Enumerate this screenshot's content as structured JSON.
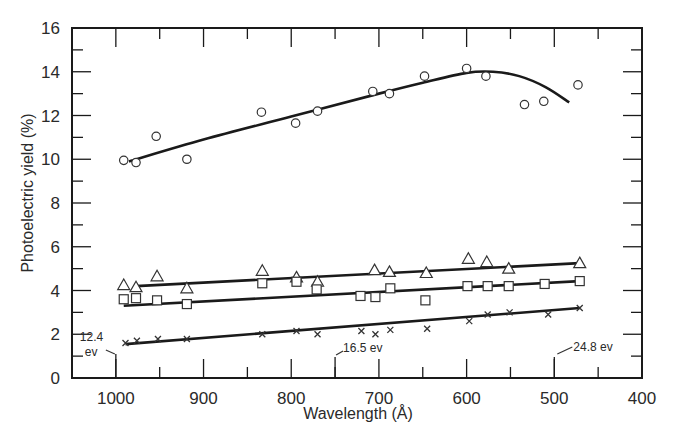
{
  "chart_data": {
    "type": "scatter",
    "title": "",
    "xlabel": "Wavelength (Å)",
    "ylabel": "Photoelectric yield (%)",
    "xlim": [
      1050,
      400
    ],
    "ylim": [
      0,
      16
    ],
    "x_reversed": true,
    "grid": false,
    "legend": null,
    "x_ticks": [
      1000,
      900,
      800,
      700,
      600,
      500,
      400
    ],
    "x_minor_ticks": [
      950,
      850,
      750,
      650,
      550,
      450
    ],
    "y_ticks": [
      0,
      2,
      4,
      6,
      8,
      10,
      12,
      14,
      16
    ],
    "y_minor_ticks": [
      1,
      3,
      5,
      7,
      9,
      11,
      13,
      15
    ],
    "annotations": [
      {
        "text_line1": "12.4",
        "text_line2": "ev",
        "x": 1000,
        "note": "arrow to 1000 Å tick"
      },
      {
        "text": "16.5 ev",
        "x": 750,
        "note": "arrow to 750 Å tick"
      },
      {
        "text": "24.8 ev",
        "x": 500,
        "note": "arrow to 500 Å tick"
      }
    ],
    "series": [
      {
        "name": "circles",
        "marker": "circle",
        "fit": "smooth curve",
        "x": [
          991,
          977,
          954,
          919,
          834,
          795,
          770,
          707,
          688,
          648,
          600,
          578,
          534,
          512,
          473
        ],
        "y": [
          9.95,
          9.85,
          11.05,
          10.0,
          12.15,
          11.65,
          12.2,
          13.1,
          13.0,
          13.8,
          14.15,
          13.8,
          12.5,
          12.65,
          13.4
        ],
        "fit_curve": {
          "x": [
            985,
            900,
            800,
            700,
            650,
            600,
            570,
            540,
            510,
            483
          ],
          "y": [
            9.9,
            10.9,
            11.95,
            13.0,
            13.5,
            13.95,
            14.0,
            13.8,
            13.3,
            12.6
          ]
        }
      },
      {
        "name": "triangles",
        "marker": "triangle",
        "fit": "straight line",
        "x": [
          991,
          977,
          953,
          919,
          833,
          794,
          770,
          705,
          688,
          646,
          598,
          577,
          552,
          471
        ],
        "y": [
          4.25,
          4.15,
          4.65,
          4.1,
          4.9,
          4.6,
          4.4,
          4.93,
          4.85,
          4.8,
          5.45,
          5.3,
          5.0,
          5.25
        ],
        "fit_line": {
          "x": [
            977,
            471
          ],
          "y": [
            4.2,
            5.25
          ]
        }
      },
      {
        "name": "squares",
        "marker": "square",
        "fit": "straight line",
        "x": [
          991,
          977,
          953,
          919,
          833,
          794,
          771,
          721,
          704,
          687,
          647,
          599,
          576,
          552,
          511,
          471
        ],
        "y": [
          3.6,
          3.65,
          3.55,
          3.38,
          4.33,
          4.4,
          4.05,
          3.75,
          3.7,
          4.1,
          3.55,
          4.2,
          4.2,
          4.2,
          4.3,
          4.43
        ],
        "fit_line": {
          "x": [
            991,
            471
          ],
          "y": [
            3.3,
            4.43
          ]
        }
      },
      {
        "name": "crosses",
        "marker": "x",
        "fit": "straight line",
        "x": [
          989,
          976,
          952,
          919,
          833,
          794,
          770,
          720,
          704,
          687,
          645,
          597,
          576,
          551,
          507,
          471
        ],
        "y": [
          1.6,
          1.7,
          1.78,
          1.78,
          2.0,
          2.15,
          2.0,
          2.15,
          2.0,
          2.2,
          2.25,
          2.6,
          2.9,
          3.0,
          2.9,
          3.2
        ],
        "fit_line": {
          "x": [
            989,
            471
          ],
          "y": [
            1.55,
            3.2
          ]
        }
      }
    ]
  }
}
